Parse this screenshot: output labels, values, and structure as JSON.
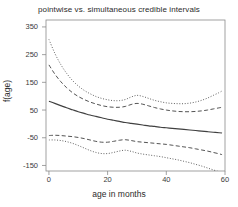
{
  "chart_data": {
    "type": "line",
    "title": "pointwise vs. simultaneous credible intervals",
    "xlabel": "age in months",
    "ylabel": "f(age)",
    "xlim": [
      -1,
      60
    ],
    "ylim": [
      -170,
      375
    ],
    "xticks": [
      0,
      20,
      40,
      60
    ],
    "yticks": [
      350,
      250,
      150,
      50,
      -50,
      -150
    ],
    "xtick_labels": [
      "0",
      "20",
      "40",
      "60"
    ],
    "ytick_labels": [
      "350",
      "250",
      "150",
      "50",
      "-50",
      "-150"
    ],
    "grid": false,
    "legend": "none",
    "x": [
      0,
      2,
      4,
      6,
      8,
      10,
      12,
      14,
      16,
      18,
      20,
      22,
      24,
      26,
      28,
      30,
      32,
      34,
      36,
      38,
      40,
      42,
      44,
      46,
      48,
      50,
      52,
      54,
      56,
      58,
      59
    ],
    "series": [
      {
        "name": "posterior mean",
        "style": "solid",
        "color": "#404040",
        "values": [
          82,
          74,
          66,
          58,
          51,
          44,
          38,
          32,
          27,
          22,
          17,
          13,
          9,
          5,
          2,
          -1,
          -4,
          -7,
          -9,
          -12,
          -14,
          -16,
          -18,
          -20,
          -22,
          -24,
          -26,
          -28,
          -30,
          -32,
          -33
        ]
      },
      {
        "name": "pointwise upper",
        "style": "dashed",
        "color": "#4a4a4a",
        "values": [
          213,
          180,
          153,
          131,
          113,
          99,
          88,
          79,
          72,
          66,
          62,
          60,
          60,
          63,
          70,
          74,
          71,
          65,
          59,
          54,
          50,
          47,
          45,
          44,
          44,
          45,
          47,
          50,
          54,
          58,
          60
        ]
      },
      {
        "name": "pointwise lower",
        "style": "dashed",
        "color": "#4a4a4a",
        "values": [
          -42,
          -41,
          -42,
          -44,
          -46,
          -49,
          -53,
          -58,
          -63,
          -66,
          -66,
          -63,
          -59,
          -57,
          -60,
          -64,
          -66,
          -68,
          -70,
          -72,
          -74,
          -77,
          -80,
          -83,
          -86,
          -90,
          -94,
          -98,
          -103,
          -108,
          -111
        ]
      },
      {
        "name": "simultaneous upper",
        "style": "dotted",
        "color": "#5a5a5a",
        "values": [
          305,
          255,
          215,
          183,
          157,
          137,
          121,
          109,
          99,
          92,
          87,
          84,
          84,
          88,
          97,
          103,
          99,
          92,
          85,
          80,
          76,
          74,
          73,
          73,
          75,
          79,
          85,
          93,
          103,
          113,
          119
        ]
      },
      {
        "name": "simultaneous lower",
        "style": "dotted",
        "color": "#5a5a5a",
        "values": [
          -58,
          -58,
          -60,
          -64,
          -70,
          -78,
          -87,
          -96,
          -103,
          -107,
          -107,
          -103,
          -98,
          -95,
          -99,
          -105,
          -109,
          -112,
          -115,
          -118,
          -122,
          -126,
          -130,
          -135,
          -140,
          -146,
          -152,
          -159,
          -166,
          -173,
          -177
        ]
      }
    ]
  }
}
